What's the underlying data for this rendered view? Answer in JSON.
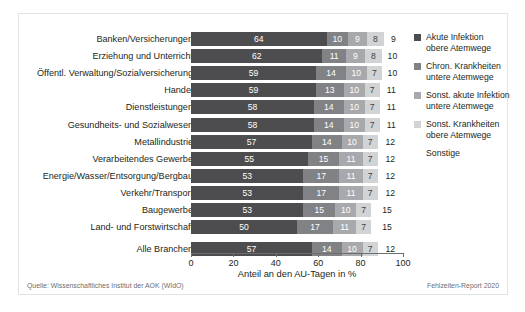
{
  "chart_data": {
    "type": "bar",
    "orientation": "horizontal",
    "stacked": true,
    "title": "",
    "xlabel": "Anteil an den AU-Tagen in %",
    "ylabel": "",
    "xlim": [
      0,
      100
    ],
    "xticks": [
      0,
      20,
      40,
      60,
      80,
      100
    ],
    "grid": false,
    "legend_position": "right",
    "categories": [
      "Banken/Versicherungen",
      "Erziehung und Unterricht",
      "Öffentl. Verwaltung/Sozialversicherung",
      "Handel",
      "Dienstleistungen",
      "Gesundheits- und Sozialwesen",
      "Metallindustrie",
      "Verarbeitendes Gewerbe",
      "Energie/Wasser/Entsorgung/Bergbau",
      "Verkehr/Transport",
      "Baugewerbe",
      "Land- und Forstwirtschaft",
      "Alle Branchen"
    ],
    "series": [
      {
        "name": "Akute Infektion obere Atemwege",
        "color": "#4d4d4f",
        "values": [
          64,
          62,
          59,
          59,
          58,
          58,
          57,
          55,
          53,
          53,
          53,
          50,
          57
        ]
      },
      {
        "name": "Chron. Krankheiten untere Atemwege",
        "color": "#808285",
        "values": [
          10,
          11,
          14,
          13,
          14,
          14,
          14,
          15,
          17,
          17,
          15,
          17,
          14
        ]
      },
      {
        "name": "Sonst. akute Infektion untere Atemwege",
        "color": "#a7a9ac",
        "values": [
          9,
          9,
          10,
          10,
          10,
          10,
          10,
          11,
          11,
          11,
          10,
          11,
          10
        ]
      },
      {
        "name": "Sonst. Krankheiten obere Atemwege",
        "color": "#d1d3d4",
        "values": [
          8,
          8,
          7,
          7,
          7,
          7,
          7,
          7,
          7,
          7,
          7,
          7,
          7
        ]
      },
      {
        "name": "Sonstige",
        "color": "#ffffff",
        "values": [
          9,
          10,
          10,
          11,
          11,
          11,
          12,
          12,
          12,
          12,
          15,
          15,
          12
        ]
      }
    ]
  },
  "legend": {
    "items": [
      {
        "label_line1": "Akute Infektion",
        "label_line2": "obere Atemwege",
        "color": "#4d4d4f"
      },
      {
        "label_line1": "Chron. Krankheiten",
        "label_line2": "untere Atemwege",
        "color": "#808285"
      },
      {
        "label_line1": "Sonst. akute Infektion",
        "label_line2": "untere Atemwege",
        "color": "#a7a9ac"
      },
      {
        "label_line1": "Sonst. Krankheiten",
        "label_line2": "obere Atemwege",
        "color": "#d1d3d4"
      },
      {
        "label_line1": "Sonstige",
        "label_line2": "",
        "color": "#ffffff"
      }
    ]
  },
  "axis": {
    "xlabel": "Anteil an den AU-Tagen in %",
    "ticks": [
      "0",
      "20",
      "40",
      "60",
      "80",
      "100"
    ]
  },
  "footer": {
    "source": "Quelle: Wissenschaftliches Institut der AOK (WIdO)",
    "report": "Fehlzeiten-Report 2020"
  }
}
